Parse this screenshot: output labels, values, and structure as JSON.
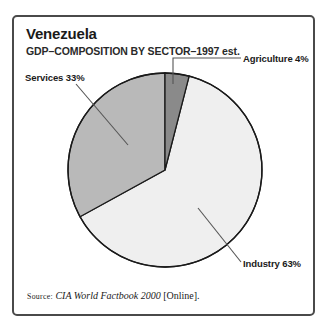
{
  "figure": {
    "title": "Venezuela",
    "subtitle": "GDP–COMPOSITION BY SECTOR–1997 est.",
    "source": {
      "keyword": "Source:",
      "publication": "CIA World Factbook 2000",
      "suffix": "[Online]."
    }
  },
  "chart_data": {
    "type": "pie",
    "title": "Venezuela",
    "subtitle": "GDP–COMPOSITION BY SECTOR–1997 est.",
    "xlabel": "",
    "ylabel": "",
    "unit": "percent",
    "start_angle_deg": 0,
    "direction": "clockwise",
    "legend": "callout-labels",
    "grid": false,
    "categories": [
      "Agriculture",
      "Industry",
      "Services"
    ],
    "values": [
      4,
      63,
      33
    ],
    "labels": [
      "Agriculture 4%",
      "Industry 63%",
      "Services 33%"
    ],
    "colors": [
      "#8a8a8a",
      "#efefef",
      "#b9b9b9"
    ],
    "slices": [
      {
        "name": "Agriculture",
        "value": 4,
        "label": "Agriculture 4%",
        "color": "#8a8a8a",
        "start_deg": 0,
        "end_deg": 14.4
      },
      {
        "name": "Industry",
        "value": 63,
        "label": "Industry 63%",
        "color": "#efefef",
        "start_deg": 14.4,
        "end_deg": 241.2
      },
      {
        "name": "Services",
        "value": 33,
        "label": "Services 33%",
        "color": "#b9b9b9",
        "start_deg": 241.2,
        "end_deg": 360
      }
    ]
  },
  "style": {
    "frame_color": "#4a4a4a",
    "outline_color": "#1a1a1a",
    "leader_color": "#555555",
    "background": "#ffffff"
  }
}
